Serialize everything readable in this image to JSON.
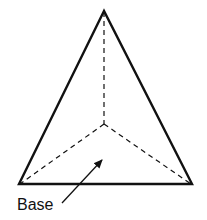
{
  "diagram": {
    "type": "pyramid-top-view",
    "shape": "triangular pyramid (tetrahedron)",
    "labels": {
      "base": "Base"
    },
    "colors": {
      "stroke": "#111111",
      "background": "#ffffff"
    },
    "vertices": {
      "apex": [
        104,
        11
      ],
      "left": [
        19,
        184
      ],
      "right": [
        192,
        184
      ],
      "center": [
        104,
        124
      ]
    }
  }
}
